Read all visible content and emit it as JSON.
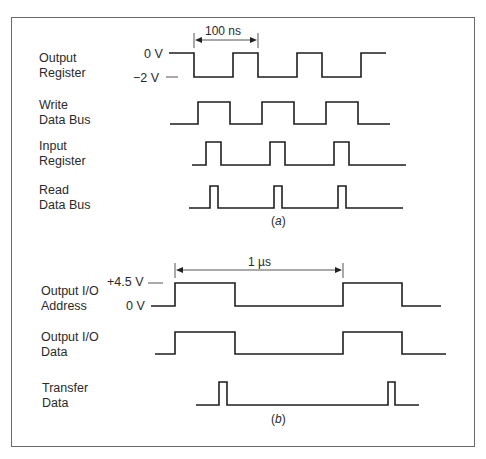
{
  "figure": {
    "panel_a": {
      "caption_prefix": "(",
      "caption_letter": "a",
      "caption_suffix": ")",
      "dimension_label": "100 ns",
      "voltage_levels": {
        "high": "0 V",
        "low": "−2 V"
      },
      "signals": [
        {
          "name_line1": "Output",
          "name_line2": "Register"
        },
        {
          "name_line1": "Write",
          "name_line2": "Data Bus"
        },
        {
          "name_line1": "Input",
          "name_line2": "Register"
        },
        {
          "name_line1": "Read",
          "name_line2": "Data Bus"
        }
      ]
    },
    "panel_b": {
      "caption_prefix": "(",
      "caption_letter": "b",
      "caption_suffix": ")",
      "dimension_label": "1 µs",
      "voltage_levels": {
        "high": "+4.5 V",
        "low": "0 V"
      },
      "signals": [
        {
          "name_line1": "Output I/O",
          "name_line2": "Address"
        },
        {
          "name_line1": "Output I/O",
          "name_line2": "Data"
        },
        {
          "name_line1": "Transfer",
          "name_line2": "Data"
        }
      ]
    }
  },
  "waveforms": [
    {
      "id": "output-register",
      "high_y": 53,
      "low_y": 77,
      "start_level": "high",
      "x_start": 169,
      "transitions": [
        194,
        233,
        258,
        297,
        322,
        361
      ],
      "x_end": 386
    },
    {
      "id": "write-data-bus",
      "high_y": 102,
      "low_y": 124,
      "start_level": "low",
      "x_start": 170,
      "transitions": [
        198,
        230,
        262,
        294,
        326,
        358
      ],
      "x_end": 390
    },
    {
      "id": "input-register",
      "high_y": 142,
      "low_y": 165,
      "start_level": "low",
      "x_start": 192,
      "transitions": [
        206,
        221,
        270,
        285,
        334,
        349
      ],
      "x_end": 406
    },
    {
      "id": "read-data-bus",
      "high_y": 186,
      "low_y": 208,
      "start_level": "low",
      "x_start": 189,
      "transitions": [
        210,
        218,
        274,
        282,
        338,
        346
      ],
      "x_end": 403
    },
    {
      "id": "output-io-address",
      "high_y": 283,
      "low_y": 306,
      "start_level": "low",
      "x_start": 151,
      "transitions": [
        175,
        235,
        343,
        402
      ],
      "x_end": 441
    },
    {
      "id": "output-io-data",
      "high_y": 332,
      "low_y": 354,
      "start_level": "low",
      "x_start": 155,
      "transitions": [
        175,
        235,
        343,
        402
      ],
      "x_end": 446
    },
    {
      "id": "transfer-data",
      "high_y": 382,
      "low_y": 405,
      "start_level": "low",
      "x_start": 196,
      "transitions": [
        219,
        227,
        388,
        395
      ],
      "x_end": 419
    }
  ],
  "dimensions": [
    {
      "id": "dim-100ns",
      "x1": 194,
      "x2": 258,
      "y": 40,
      "tick_top": 33,
      "tick_bottom": 48
    },
    {
      "id": "dim-1us",
      "x1": 175,
      "x2": 343,
      "y": 270,
      "tick_top": 263,
      "tick_bottom": 278
    }
  ],
  "colors": {
    "line": "#1e1e1e",
    "frame": "#6a6a6a",
    "text": "#2a2a2a",
    "background": "#ffffff"
  }
}
